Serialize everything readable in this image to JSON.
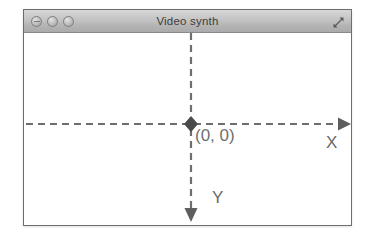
{
  "window": {
    "title": "Video synth",
    "controls": [
      {
        "name": "close-button",
        "label": "Close"
      },
      {
        "name": "minimize-button",
        "label": "Minimize"
      },
      {
        "name": "zoom-button",
        "label": "Zoom"
      }
    ],
    "resize_icon": "resize-maximize-icon"
  },
  "canvas": {
    "origin_label": "(0, 0)",
    "x_axis_label": "X",
    "y_axis_label": "Y",
    "colors": {
      "axis": "#6e6e6e",
      "titlebar_text": "#3d3d3d",
      "label_text": "#6b6b6b",
      "window_border": "#6e6e6e",
      "canvas_background": "#ffffff"
    },
    "axis_dash_pattern": "7 5",
    "origin_marker": "diamond-origin-marker",
    "x_axis_direction": "right",
    "y_axis_direction": "down"
  }
}
